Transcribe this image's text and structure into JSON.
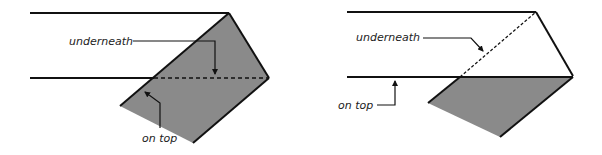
{
  "colors": {
    "stroke": "#111111",
    "fill": "#8a8a8a",
    "background": "#ffffff"
  },
  "diagrams": [
    {
      "id": "left",
      "labels": {
        "underneath": "underneath",
        "on_top": "on top"
      }
    },
    {
      "id": "right",
      "labels": {
        "underneath": "underneath",
        "on_top": "on top"
      }
    }
  ]
}
